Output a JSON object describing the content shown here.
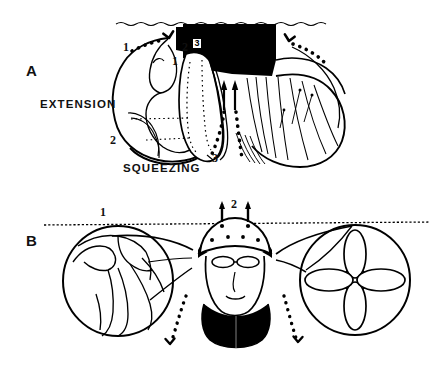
{
  "figure": {
    "background_color": "#ffffff",
    "ink_color": "#000000",
    "width": 441,
    "height": 368
  },
  "panel_a": {
    "letter": "A",
    "caption_left": "EXTENSION",
    "caption_bottom": "SQUEEZING",
    "callouts": [
      {
        "id": "a-1-left",
        "text": "1"
      },
      {
        "id": "a-2-left",
        "text": "2"
      },
      {
        "id": "a-1-inner",
        "text": "1"
      },
      {
        "id": "a-2-inner",
        "text": "2"
      },
      {
        "id": "a-3-boxed",
        "text": "3"
      },
      {
        "id": "a-3-lower",
        "text": "3"
      }
    ],
    "boxed_label": "3"
  },
  "panel_b": {
    "letter": "B",
    "callouts": [
      {
        "id": "b-1",
        "text": "1"
      },
      {
        "id": "b-2",
        "text": "2"
      }
    ]
  }
}
